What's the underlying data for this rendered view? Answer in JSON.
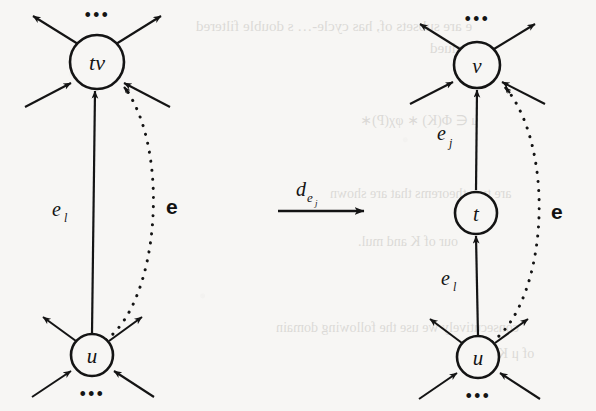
{
  "figure": {
    "type": "diagram",
    "background_color": "#f7f6f4",
    "ink_color": "#141414",
    "width": 596,
    "height": 411
  },
  "left_graph": {
    "name": "before-transformation",
    "nodes": [
      {
        "id": "tv",
        "label": "tv",
        "cx": 97,
        "cy": 62,
        "r": 27
      },
      {
        "id": "u",
        "label": "u",
        "cx": 92,
        "cy": 355,
        "r": 21
      }
    ],
    "ellipsis_top": "•••",
    "ellipsis_bottom": "•••",
    "solid_edge": {
      "from": "u",
      "to": "tv",
      "label": "e",
      "label_subscript": "l"
    },
    "dotted_edge": {
      "from": "u",
      "to": "tv",
      "label": "e",
      "style": "dotted-bold-label"
    }
  },
  "right_graph": {
    "name": "after-transformation",
    "nodes": [
      {
        "id": "v",
        "label": "v",
        "cx": 477,
        "cy": 65,
        "r": 23
      },
      {
        "id": "t",
        "label": "t",
        "cx": 476,
        "cy": 213,
        "r": 21
      },
      {
        "id": "u",
        "label": "u",
        "cx": 478,
        "cy": 357,
        "r": 21
      }
    ],
    "ellipsis_top": "•••",
    "ellipsis_bottom": "•••",
    "edges": [
      {
        "from": "t",
        "to": "v",
        "label": "e",
        "label_subscript": "j"
      },
      {
        "from": "u",
        "to": "t",
        "label": "e",
        "label_subscript": "l"
      }
    ],
    "dotted_edge": {
      "from": "u",
      "to": "v",
      "label": "e",
      "style": "dotted-bold-label"
    }
  },
  "transform_arrow": {
    "name": "transformation-arrow",
    "label_base": "d",
    "label_subscript": "e",
    "label_subsubscript": "j",
    "x1": 278,
    "x2": 366,
    "y": 211
  },
  "background_bleed": [
    {
      "text": "e are subsets of, has cycle-… s double filtered",
      "x": 196,
      "y": 18,
      "size": 15
    },
    {
      "text": "e valued",
      "x": 430,
      "y": 40,
      "size": 15
    },
    {
      "text": "μ ∈ Φ(K) ∗ φχ(P)∗",
      "x": 360,
      "y": 112,
      "size": 14
    },
    {
      "text": "are two theorems that are shown",
      "x": 330,
      "y": 186,
      "size": 14
    },
    {
      "text": "our of K and mul.",
      "x": 358,
      "y": 234,
      "size": 14
    },
    {
      "text": "consecutively we use the following domain",
      "x": 276,
      "y": 320,
      "size": 14
    },
    {
      "text": "of μ K",
      "x": 498,
      "y": 346,
      "size": 14
    }
  ]
}
